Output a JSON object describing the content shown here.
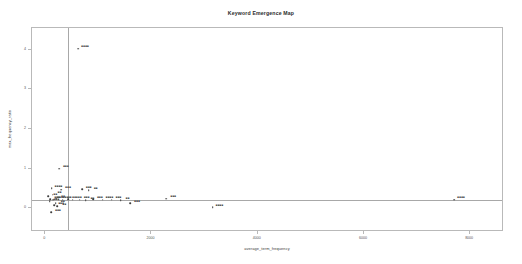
{
  "chart_data": {
    "type": "scatter",
    "title": "Keyword Emergence Map",
    "xlabel": "average_term_frequency",
    "ylabel": "max_frequency_ratio",
    "xlim": [
      -250,
      8600
    ],
    "ylim": [
      -0.55,
      4.55
    ],
    "grid": false,
    "legend": null,
    "reference_lines": {
      "vertical_x": 420,
      "horizontal_y": 0.22
    },
    "xticks": [
      0,
      2000,
      4000,
      6000,
      8000
    ],
    "xticklabels": [
      "0",
      "2000",
      "4000",
      "6000",
      "8000"
    ],
    "yticks": [
      0,
      1,
      2,
      3,
      4
    ],
    "yticklabels": [
      "0",
      "1",
      "2",
      "3",
      "4"
    ],
    "points": [
      {
        "label": "■■■■",
        "x": 620,
        "y": 4.03
      },
      {
        "label": "■■■",
        "x": 260,
        "y": 1.0
      },
      {
        "label": "■■■■",
        "x": 120,
        "y": 0.5
      },
      {
        "label": "■■■",
        "x": 300,
        "y": 0.47
      },
      {
        "label": "■■■",
        "x": 690,
        "y": 0.48
      },
      {
        "label": "■■",
        "x": 820,
        "y": 0.45
      },
      {
        "label": "■■■",
        "x": 95,
        "y": 0.23
      },
      {
        "label": "■■■",
        "x": 150,
        "y": 0.22
      },
      {
        "label": "■■",
        "x": 205,
        "y": 0.24
      },
      {
        "label": "■■■",
        "x": 250,
        "y": 0.21
      },
      {
        "label": "■■",
        "x": 330,
        "y": 0.22
      },
      {
        "label": "■■■",
        "x": 430,
        "y": 0.23
      },
      {
        "label": "■■",
        "x": 520,
        "y": 0.21
      },
      {
        "label": "■■■",
        "x": 650,
        "y": 0.22
      },
      {
        "label": "■■",
        "x": 760,
        "y": 0.2
      },
      {
        "label": "■■■",
        "x": 900,
        "y": 0.23
      },
      {
        "label": "■■■■",
        "x": 1080,
        "y": 0.22
      },
      {
        "label": "■■■",
        "x": 1250,
        "y": 0.21
      },
      {
        "label": "■■",
        "x": 1420,
        "y": 0.2
      },
      {
        "label": "■■■",
        "x": 1600,
        "y": 0.13
      },
      {
        "label": "■■■",
        "x": 2280,
        "y": 0.24
      },
      {
        "label": "■■■■",
        "x": 3150,
        "y": 0.03
      },
      {
        "label": "■■■■",
        "x": 7700,
        "y": 0.22
      },
      {
        "label": "■■■",
        "x": 170,
        "y": 0.07
      },
      {
        "label": "■■",
        "x": 230,
        "y": 0.05
      },
      {
        "label": "■■■",
        "x": 110,
        "y": -0.1
      },
      {
        "label": "■■",
        "x": 60,
        "y": 0.3
      },
      {
        "label": "■■",
        "x": 140,
        "y": 0.34
      },
      {
        "label": "■■■",
        "x": 80,
        "y": 0.18
      },
      {
        "label": "■■",
        "x": 200,
        "y": 0.12
      }
    ]
  }
}
